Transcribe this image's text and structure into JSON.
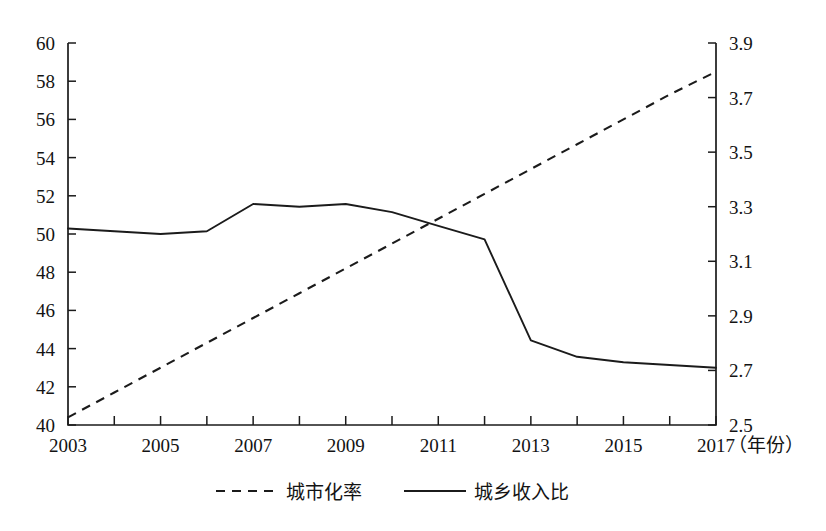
{
  "chart_data": {
    "type": "line",
    "title": "",
    "xlabel": "年份",
    "xlabel_display": "（年份）",
    "grid": false,
    "legend_position": "bottom",
    "x": [
      2003,
      2004,
      2005,
      2006,
      2007,
      2008,
      2009,
      2010,
      2011,
      2012,
      2013,
      2014,
      2015,
      2016,
      2017
    ],
    "xlim": [
      2003,
      2017
    ],
    "xticks": [
      2003,
      2004,
      2005,
      2006,
      2007,
      2008,
      2009,
      2010,
      2011,
      2012,
      2013,
      2014,
      2015,
      2016,
      2017
    ],
    "xtick_labels": [
      "2003",
      "",
      "2005",
      "",
      "2007",
      "",
      "2009",
      "",
      "2011",
      "",
      "2013",
      "",
      "2015",
      "",
      "2017"
    ],
    "xtick_labels_shown": [
      "2003",
      "2005",
      "2007",
      "2009",
      "2011",
      "2013",
      "2015",
      "2017"
    ],
    "left_axis": {
      "ylabel": "",
      "ylim": [
        40,
        60
      ],
      "yticks": [
        40,
        42,
        44,
        46,
        48,
        50,
        52,
        54,
        56,
        58,
        60
      ],
      "ytick_labels": [
        "40",
        "42",
        "44",
        "46",
        "48",
        "50",
        "52",
        "54",
        "56",
        "58",
        "60"
      ]
    },
    "right_axis": {
      "ylabel": "",
      "ylim": [
        2.5,
        3.9
      ],
      "yticks": [
        2.5,
        2.7,
        2.9,
        3.1,
        3.3,
        3.5,
        3.7,
        3.9
      ],
      "ytick_labels": [
        "2.5",
        "2.7",
        "2.9",
        "3.1",
        "3.3",
        "3.5",
        "3.7",
        "3.9"
      ]
    },
    "series": [
      {
        "name": "城市化率",
        "axis": "left",
        "style": "dashed",
        "color": "#1b1b1b",
        "values": [
          40.4,
          41.7,
          43.0,
          44.3,
          45.6,
          46.9,
          48.2,
          49.5,
          50.8,
          52.1,
          53.4,
          54.7,
          56.0,
          57.3,
          58.5
        ]
      },
      {
        "name": "城乡收入比",
        "axis": "right",
        "style": "solid",
        "color": "#1b1b1b",
        "values": [
          3.22,
          3.21,
          3.2,
          3.21,
          3.31,
          3.3,
          3.31,
          3.28,
          3.23,
          3.18,
          2.81,
          2.75,
          2.73,
          2.72,
          2.71
        ]
      }
    ]
  },
  "legend": {
    "items": [
      {
        "label": "城市化率",
        "style": "dashed"
      },
      {
        "label": "城乡收入比",
        "style": "solid"
      }
    ]
  }
}
